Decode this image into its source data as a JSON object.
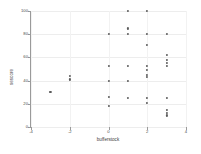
{
  "chart_data": {
    "type": "scatter",
    "title": "",
    "xlabel": "bufferstock",
    "ylabel": "sescore",
    "xlim": [
      -4,
      4
    ],
    "ylim": [
      0,
      100
    ],
    "xticks": [
      -4,
      -2,
      0,
      2,
      4
    ],
    "xtick_labels": [
      "-4",
      "-2",
      "0",
      "2",
      "4"
    ],
    "yticks": [
      0,
      20,
      40,
      60,
      80,
      100
    ],
    "ytick_labels": [
      "0",
      "20",
      "40",
      "60",
      "80",
      "100"
    ],
    "grid": true,
    "legend": "none",
    "marker": "filled-circle",
    "marker_color": "#5b5b5b",
    "points": [
      {
        "x": -3,
        "y": 30
      },
      {
        "x": -2,
        "y": 44
      },
      {
        "x": -2,
        "y": 41
      },
      {
        "x": 0,
        "y": 80
      },
      {
        "x": 0,
        "y": 53
      },
      {
        "x": 0,
        "y": 40
      },
      {
        "x": 0,
        "y": 26
      },
      {
        "x": 0,
        "y": 18
      },
      {
        "x": 1,
        "y": 100
      },
      {
        "x": 1,
        "y": 85
      },
      {
        "x": 1,
        "y": 80
      },
      {
        "x": 1,
        "y": 53
      },
      {
        "x": 1,
        "y": 40
      },
      {
        "x": 1,
        "y": 25
      },
      {
        "x": 2,
        "y": 100
      },
      {
        "x": 2,
        "y": 80
      },
      {
        "x": 2,
        "y": 71
      },
      {
        "x": 2,
        "y": 53
      },
      {
        "x": 2,
        "y": 49
      },
      {
        "x": 2,
        "y": 45
      },
      {
        "x": 2,
        "y": 43
      },
      {
        "x": 2,
        "y": 25
      },
      {
        "x": 2,
        "y": 21
      },
      {
        "x": 3,
        "y": 80
      },
      {
        "x": 3,
        "y": 62
      },
      {
        "x": 3,
        "y": 58
      },
      {
        "x": 3,
        "y": 55
      },
      {
        "x": 3,
        "y": 53
      },
      {
        "x": 3,
        "y": 25
      },
      {
        "x": 3,
        "y": 15
      },
      {
        "x": 3,
        "y": 12
      },
      {
        "x": 3,
        "y": 10
      }
    ]
  }
}
